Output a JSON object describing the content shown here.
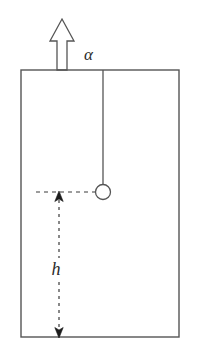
{
  "figure": {
    "name": "pendulum-in-accelerating-box",
    "background_color": "#ffffff",
    "stroke_color": "#555555",
    "label_color": "#2b2b2b",
    "width": 198,
    "height": 358
  },
  "box": {
    "name": "container-box",
    "x": 21,
    "y": 70,
    "width": 158,
    "height": 267,
    "stroke_width": 1.4,
    "fill": "none"
  },
  "acceleration": {
    "arrow_name": "acceleration-arrow",
    "direction": "up",
    "tip_y": 19,
    "base_y": 70,
    "shaft_left": 57,
    "shaft_right": 67,
    "head_left": 50,
    "head_right": 74,
    "head_base_y": 41,
    "label": "α",
    "label_x": 84,
    "label_y": 60,
    "label_font_size": 17
  },
  "pendulum": {
    "string_name": "pendulum-string",
    "string_x": 103,
    "string_top_y": 70,
    "string_bottom_y": 185,
    "bob_name": "pendulum-bob",
    "bob_cx": 103,
    "bob_cy": 192,
    "bob_r": 7.5,
    "bob_fill": "#ffffff"
  },
  "height_dimension": {
    "name": "height-dimension",
    "label": "h",
    "label_x": 56,
    "label_y": 275,
    "label_font_size": 18,
    "line_x": 59,
    "top_y": 192,
    "bottom_y": 337,
    "gap_top_y": 258,
    "gap_bottom_y": 282,
    "dash_pattern": "3,4",
    "arrowhead_up": true,
    "arrowhead_down": true
  },
  "reference_line": {
    "name": "bob-level-reference-line",
    "y": 192,
    "x_start": 36,
    "x_end": 95,
    "dash_pattern": "4,4"
  }
}
